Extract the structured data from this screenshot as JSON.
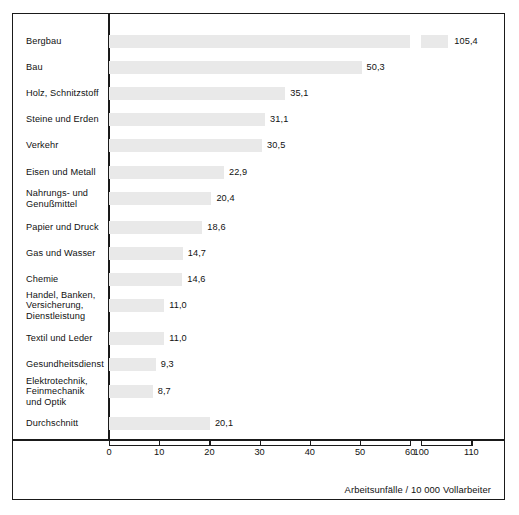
{
  "chart_data": {
    "type": "bar",
    "orientation": "horizontal",
    "title": "",
    "xlabel": "Arbeitsunfälle / 10 000 Vollarbeiter",
    "ylabel": "",
    "categories": [
      "Bergbau",
      "Bau",
      "Holz, Schnitzstoff",
      "Steine und Erden",
      "Verkehr",
      "Eisen und Metall",
      "Nahrungs- und\nGenußmittel",
      "Papier und Druck",
      "Gas und Wasser",
      "Chemie",
      "Handel, Banken,\nVersicherung,\nDienstleistung",
      "Textil und Leder",
      "Gesundheitsdienst",
      "Elektrotechnik,\nFeinmechanik\nund Optik",
      "Durchschnitt"
    ],
    "values": [
      105.4,
      50.3,
      35.1,
      31.1,
      30.5,
      22.9,
      20.4,
      18.6,
      14.7,
      14.6,
      11.0,
      11.0,
      9.3,
      8.7,
      20.1
    ],
    "value_labels": [
      "105,4",
      "50,3",
      "35,1",
      "31,1",
      "30,5",
      "22,9",
      "20,4",
      "18,6",
      "14,7",
      "14,6",
      "11,0",
      "11,0",
      "9,3",
      "8,7",
      "20,1"
    ],
    "axis": {
      "broken": true,
      "segment1_ticks": [
        0,
        10,
        20,
        30,
        40,
        50,
        60
      ],
      "segment1_tick_labels": [
        "0",
        "10",
        "20",
        "30",
        "40",
        "50",
        "60"
      ],
      "segment2_ticks": [
        100,
        110
      ],
      "segment2_tick_labels": [
        "100",
        "110"
      ],
      "xlim_segment1": [
        0,
        60
      ],
      "xlim_segment2": [
        100,
        110
      ],
      "grid": false
    },
    "legend": null,
    "bar_color": "#e9e9e9",
    "frame_color": "#1a1a1a",
    "text_color": "#111111"
  },
  "caption": {
    "text": "Arbeitsunfälle / 10 000 Vollarbeiter"
  }
}
